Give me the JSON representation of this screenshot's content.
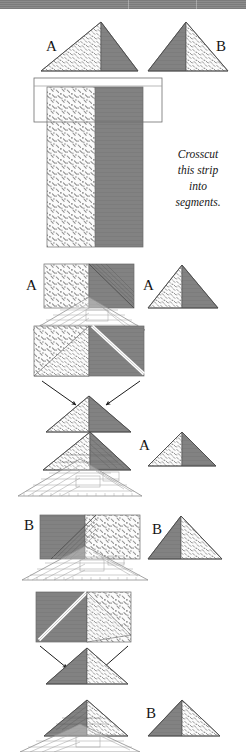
{
  "page": {
    "width": 246,
    "height": 752,
    "background": "#ffffff",
    "banner_color": "#7b7b7b"
  },
  "colors": {
    "solid_fabric": "#828282",
    "solid_fabric_dark": "#6f6f6f",
    "print_fabric_bg": "#fbfbfb",
    "print_fabric_mark": "#8a8a8a",
    "outline": "#4a4a4a",
    "ruler_line": "#9a9a9a",
    "arrow": "#1c1c1c",
    "text": "#141414"
  },
  "caption": {
    "lines": [
      "Crosscut",
      "this strip",
      "into",
      "segments."
    ],
    "line1": "Crosscut",
    "line2": "this strip",
    "line3": "into",
    "line4": "segments."
  },
  "labels": {
    "a_top_left": "A",
    "b_top_right": "B",
    "a_mid_left": "A",
    "a_mid_right": "A",
    "a_lower_mid": "A",
    "b_sect_left": "B",
    "b_sect_right": "B",
    "b_bottom": "B"
  },
  "figure": {
    "steps": [
      {
        "id": "step-1",
        "name": "finished-units",
        "description": "Finished triangle units A and B shown side by side.",
        "labels": [
          "A",
          "B"
        ]
      },
      {
        "id": "step-2",
        "name": "pieced-strip",
        "description": "Two-fabric strip with a cutting-segment rectangle marked at the top.",
        "caption": "Crosscut this strip into segments."
      },
      {
        "id": "step-3",
        "name": "unit-a-cutting",
        "description": "Segment with ruler aligned to cut unit A; resulting triangle A at right.",
        "labels": [
          "A",
          "A"
        ]
      },
      {
        "id": "step-4",
        "name": "unit-a-halves",
        "description": "Segment cut on the diagonal; arrows point to the assembled triangle.",
        "labels": []
      },
      {
        "id": "step-5",
        "name": "unit-a-trimming",
        "description": "Assembled triangle trimmed with the ruler; finished unit A at right.",
        "labels": [
          "A"
        ]
      },
      {
        "id": "step-6",
        "name": "unit-b-cutting",
        "description": "Mirror segment with ruler aligned to cut unit B; resulting triangle B at right.",
        "labels": [
          "B",
          "B"
        ]
      },
      {
        "id": "step-7",
        "name": "unit-b-halves",
        "description": "Mirror segment cut on the diagonal; arrows point to the assembled triangle.",
        "labels": []
      },
      {
        "id": "step-8",
        "name": "unit-b-trimming",
        "description": "Assembled mirror triangle trimmed with the ruler; finished unit B at right.",
        "labels": [
          "B"
        ]
      }
    ]
  }
}
